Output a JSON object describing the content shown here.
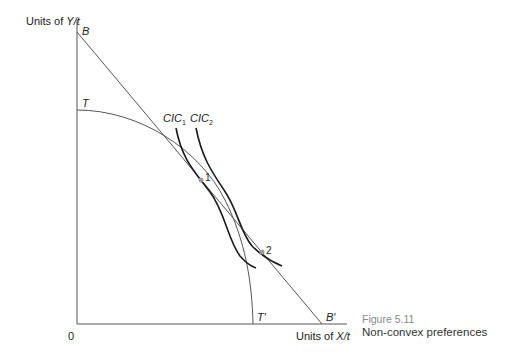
{
  "axes": {
    "y_label_prefix": "Units of ",
    "y_label_var": "Y/t",
    "x_label_prefix": "Units of ",
    "x_label_var": "X/t",
    "origin": "0"
  },
  "points": {
    "B": "B",
    "B_prime": "B′",
    "T": "T",
    "T_prime": "T′",
    "p1": "1",
    "p2": "2"
  },
  "curves": {
    "cic1_base": "CIC",
    "cic1_sub": "1",
    "cic2_base": "CIC",
    "cic2_sub": "2"
  },
  "caption": {
    "number": "Figure 5.11",
    "title": "Non-convex preferences"
  },
  "colors": {
    "axis": "#555555",
    "budget_line": "#555555",
    "ppf": "#555555",
    "indifference": "#1a1a1a",
    "point": "#9a9a9a",
    "caption_number": "#8a8a8a"
  }
}
